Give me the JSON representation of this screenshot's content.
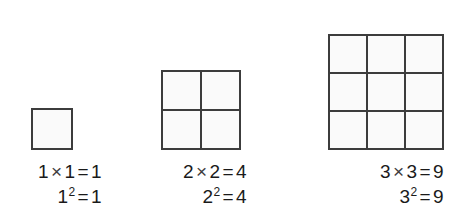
{
  "background_color": "#ffffff",
  "line_color": "#3c3c3c",
  "cell_fill_color": "#fafafa",
  "text_color": "#1a1a1a",
  "figure": {
    "name": "square-numbers-diagram",
    "groups": [
      {
        "id": "group-1",
        "n": 1,
        "rows": 1,
        "cols": 3,
        "cell_count": 1,
        "cell_size_px": 38,
        "grid_size_px": 40,
        "product_line": {
          "left": "1",
          "times": "×",
          "right": "1",
          "eq": "=",
          "result": "1"
        },
        "power_line": {
          "base": "1",
          "exponent": "2",
          "eq": "=",
          "result": "9"
        }
      },
      {
        "id": "group-2",
        "n": 2,
        "rows": 2,
        "cols": 2,
        "cell_count": 4,
        "cell_size_px": 37,
        "grid_size_px": 78,
        "product_line": {
          "left": "2",
          "times": "×",
          "right": "2",
          "eq": "=",
          "result": "4"
        },
        "power_line": {
          "base": "2",
          "exponent": "2",
          "eq": "=",
          "result": "4"
        }
      },
      {
        "id": "group-3",
        "n": 3,
        "rows": 3,
        "cols": 3,
        "cell_count": 9,
        "cell_size_px": 36,
        "grid_size_px": 116,
        "product_line": {
          "left": "3",
          "times": "×",
          "right": "3",
          "eq": "=",
          "result": "9"
        },
        "power_line": {
          "base": "3",
          "exponent": "2",
          "eq": "=",
          "result": "9"
        }
      }
    ]
  },
  "chart_data": {
    "type": "bar",
    "title": "",
    "xlabel": "",
    "ylabel": "",
    "categories": [
      "1",
      "2",
      "3"
    ],
    "values": [
      1,
      4,
      9
    ],
    "annotations": [
      "1 × 1 = 1",
      "1² = 1",
      "2 × 2 = 4",
      "2² = 4",
      "3 × 3 = 9",
      "3² = 9"
    ]
  }
}
